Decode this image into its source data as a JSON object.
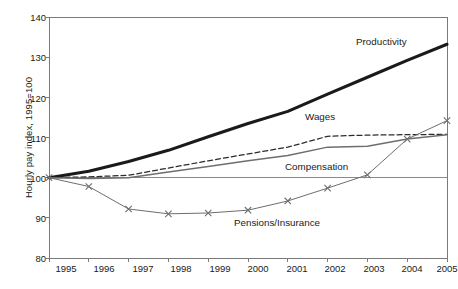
{
  "chart_data": {
    "type": "line",
    "title": "",
    "xlabel": "",
    "ylabel": "Hourly pay index, 1995=100",
    "x": [
      1995,
      1996,
      1997,
      1998,
      1999,
      2000,
      2001,
      2002,
      2003,
      2004,
      2005
    ],
    "xticklabels": [
      "1995",
      "1996",
      "1997",
      "1998",
      "1999",
      "2000",
      "2001",
      "2002",
      "2003",
      "2004",
      "2005"
    ],
    "yticklabels": [
      "80",
      "90",
      "100",
      "110",
      "120",
      "130",
      "140"
    ],
    "yticks": [
      80,
      90,
      100,
      110,
      120,
      130,
      140
    ],
    "ylim": [
      80,
      140
    ],
    "xlim": [
      1995,
      2005
    ],
    "grid": false,
    "legend_position": "inline-annotations",
    "reference_line": 100,
    "series": [
      {
        "name": "Productivity",
        "style": "solid-thick-black",
        "color": "#1a1a1a",
        "values": [
          100.0,
          101.6,
          104.0,
          106.8,
          110.2,
          113.5,
          116.5,
          120.8,
          125.0,
          129.2,
          133.2
        ]
      },
      {
        "name": "Wages",
        "style": "dashed-black",
        "color": "#2b2b2b",
        "values": [
          100.0,
          100.2,
          100.6,
          102.4,
          104.2,
          105.9,
          107.6,
          110.3,
          110.6,
          110.7,
          110.8
        ]
      },
      {
        "name": "Compensation",
        "style": "solid-thin-gray",
        "color": "#6e6e6e",
        "values": [
          100.0,
          99.8,
          100.0,
          101.4,
          102.8,
          104.2,
          105.5,
          107.6,
          107.8,
          109.6,
          110.7
        ]
      },
      {
        "name": "Pensions/Insurance",
        "style": "solid-thin-gray-x-markers",
        "color": "#6e6e6e",
        "marker": "x",
        "values": [
          100.0,
          97.8,
          92.2,
          91.0,
          91.2,
          91.9,
          94.2,
          97.4,
          100.7,
          109.6,
          114.2
        ]
      }
    ],
    "annotations": [
      {
        "text": "Productivity",
        "x_px": 356,
        "y_px": 43
      },
      {
        "text": "Wages",
        "x_px": 305,
        "y_px": 118
      },
      {
        "text": "Compensation",
        "x_px": 285,
        "y_px": 168
      },
      {
        "text": "Pensions/Insurance",
        "x_px": 234,
        "y_px": 224
      }
    ]
  }
}
